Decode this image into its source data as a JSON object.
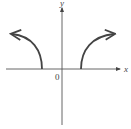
{
  "axes": {
    "x_label": "x",
    "y_label": "y",
    "origin_label": "0"
  },
  "curves": [
    {
      "name": "left-branch",
      "direction": "left",
      "start_on_x_axis": true
    },
    {
      "name": "right-branch",
      "direction": "right",
      "start_on_x_axis": true
    }
  ],
  "colors": {
    "axis": "#555555",
    "curve": "#444444"
  }
}
